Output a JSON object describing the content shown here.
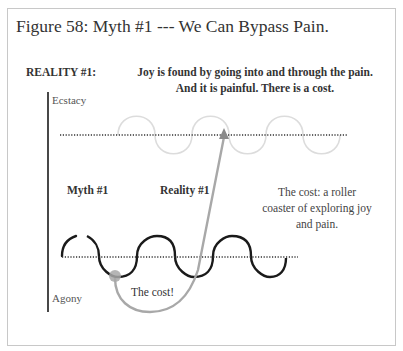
{
  "figure": {
    "title": "Figure 58: Myth #1 --- We Can Bypass Pain.",
    "reality_heading": "REALITY #1:",
    "headline_line1": "Joy is found by going into and through the pain.",
    "headline_line2": "And it is painful. There is a cost."
  },
  "axis": {
    "top_label": "Ecstacy",
    "bottom_label": "Agony"
  },
  "labels": {
    "myth": "Myth #1",
    "reality": "Reality #1",
    "cost_note": "The cost: a roller coaster of exploring joy and pain.",
    "cost_marker": "The cost!"
  },
  "colors": {
    "dark_wave": "#1a1a1a",
    "light_wave": "#dcdcdc",
    "grey_path": "#a8a8a8",
    "dotted_line": "#333333",
    "frame": "#c8c8c8"
  }
}
